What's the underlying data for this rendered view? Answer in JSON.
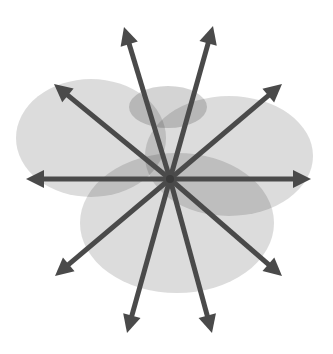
{
  "diagram": {
    "title": "",
    "background": "#ffffff",
    "center": {
      "x": 170,
      "y": 179
    },
    "arrow_color": "#4a4a4a",
    "arrow_width": 5,
    "ellipses": [
      {
        "name": "left-ellipse",
        "cx": 91,
        "cy": 138,
        "rx": 75,
        "ry": 59,
        "fill": "#d6d6d6",
        "opacity": 0.85
      },
      {
        "name": "right-ellipse",
        "cx": 229,
        "cy": 156,
        "rx": 84,
        "ry": 60,
        "fill": "#d6d6d6",
        "opacity": 0.85
      },
      {
        "name": "bottom-ellipse",
        "cx": 177,
        "cy": 223,
        "rx": 97,
        "ry": 70,
        "fill": "#d6d6d6",
        "opacity": 0.85
      },
      {
        "name": "top-small-ellipse",
        "cx": 168,
        "cy": 107,
        "rx": 39,
        "ry": 21,
        "fill": "#cfcfcf",
        "opacity": 0.9
      }
    ],
    "arrows": [
      {
        "name": "arrow-up-left-steep",
        "x": 124,
        "y": 27
      },
      {
        "name": "arrow-up-right-steep",
        "x": 213,
        "y": 26
      },
      {
        "name": "arrow-up-left",
        "x": 54,
        "y": 84
      },
      {
        "name": "arrow-up-right",
        "x": 282,
        "y": 84
      },
      {
        "name": "arrow-left",
        "x": 26,
        "y": 179
      },
      {
        "name": "arrow-right",
        "x": 311,
        "y": 179
      },
      {
        "name": "arrow-down-left",
        "x": 55,
        "y": 276
      },
      {
        "name": "arrow-down-right",
        "x": 282,
        "y": 276
      },
      {
        "name": "arrow-down-left-steep",
        "x": 127,
        "y": 333
      },
      {
        "name": "arrow-down-right-steep",
        "x": 212,
        "y": 333
      }
    ]
  }
}
